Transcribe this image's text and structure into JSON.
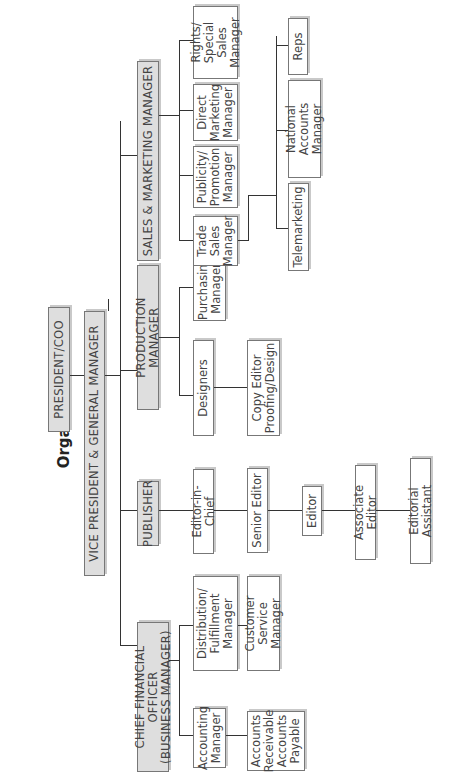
{
  "title": "Organization Chart",
  "nodes": {
    "president": "PRESIDENT/COO",
    "vp": "VICE PRESIDENT & GENERAL MANAGER",
    "cfo": "CHIEF FINANCIAL OFFICER\n(BUSINESS MANAGER)",
    "publisher": "PUBLISHER",
    "production": "PRODUCTION MANAGER",
    "sales": "SALES & MARKETING MANAGER",
    "accounting": "Accounting\nManager",
    "accounts": "Accounts\nReceivable\nAccounts\nPayable",
    "distribution": "Distribution/\nFulfillment\nManager",
    "customer_service": "Customer Service\nManager",
    "editor_in_chief": "Editor-in-Chief",
    "senior_editor": "Senior Editor",
    "editor": "Editor",
    "associate_editor": "Associate Editor",
    "editorial_assistant": "Editorial Assistant",
    "designers": "Designers",
    "copy_editor": "Copy Editor\nProofing/Design",
    "purchasing": "Purchasing\nManager",
    "trade_sales": "Trade\nSales\nManager",
    "publicity": "Publicity/\nPromotion\nManager",
    "direct_marketing": "Direct\nMarketing\nManager",
    "rights": "Rights/\nSpecial Sales\nManager",
    "telemarketing": "Telemarketing",
    "national_accounts": "National Accounts\nManager",
    "reps": "Reps"
  }
}
